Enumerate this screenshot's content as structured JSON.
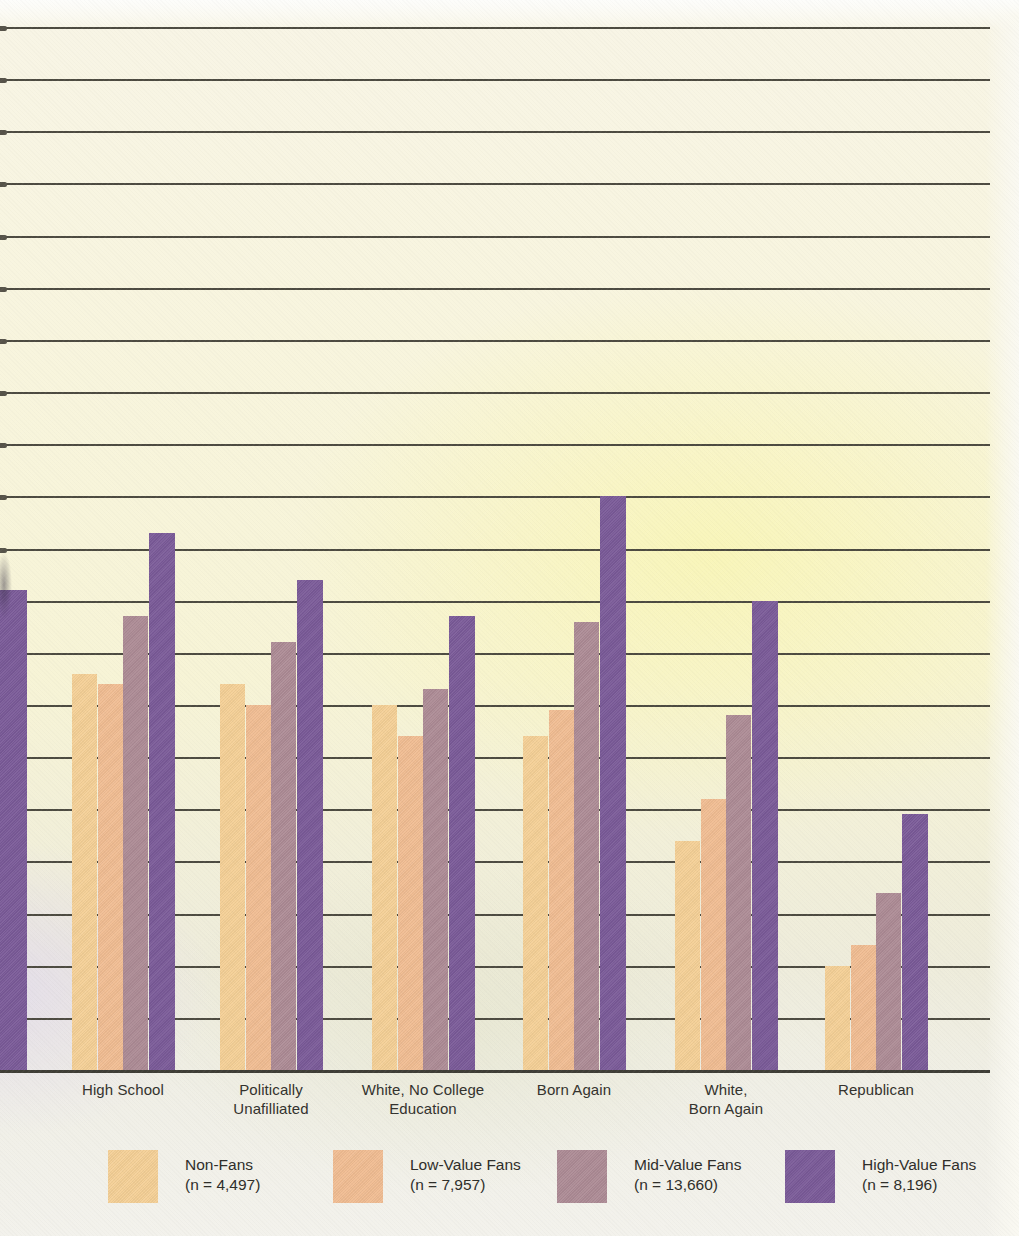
{
  "chart_data": {
    "type": "bar",
    "title": "",
    "xlabel": "",
    "ylabel": "",
    "units": "percent (estimated from gridlines; y-axis tick labels cropped out of image)",
    "ylim": [
      0,
      100
    ],
    "gridline_step": 5,
    "grid": true,
    "y_axis_tick_labels_visible": false,
    "legend_position": "bottom",
    "categories": [
      {
        "lines": [
          "High School"
        ]
      },
      {
        "lines": [
          "Politically",
          "Unafilliated"
        ]
      },
      {
        "lines": [
          "White, No College",
          "Education"
        ]
      },
      {
        "lines": [
          "Born Again"
        ]
      },
      {
        "lines": [
          "White,",
          "Born Again"
        ]
      },
      {
        "lines": [
          "Republican"
        ]
      }
    ],
    "series": [
      {
        "name": "Non-Fans",
        "n_label": "(n = 4,497)",
        "color": "#f5d096",
        "values": [
          38,
          37,
          35,
          32,
          22,
          10
        ]
      },
      {
        "name": "Low-Value Fans",
        "n_label": "(n = 7,957)",
        "color": "#f1bd92",
        "values": [
          37,
          35,
          32,
          34.5,
          26,
          12
        ]
      },
      {
        "name": "Mid-Value Fans",
        "n_label": "(n = 13,660)",
        "color": "#ad8b95",
        "values": [
          43.5,
          41,
          36.5,
          43,
          34,
          17
        ]
      },
      {
        "name": "High-Value Fans",
        "n_label": "(n = 8,196)",
        "color": "#7a5a98",
        "values": [
          51.5,
          47,
          43.5,
          55,
          45,
          24.5
        ]
      }
    ],
    "cropped_left_group": {
      "note": "group partially cut off at left edge of image; only its High-Value Fans bar is visible",
      "series": "High-Value Fans",
      "value": 46
    },
    "colors": {
      "gridline": "#4d4b41",
      "baseline": "#3f3e36",
      "label_text": "#33322d",
      "paper_cream": "#f7f4d6",
      "paper_yellow_glow": "#faf6a0"
    }
  }
}
